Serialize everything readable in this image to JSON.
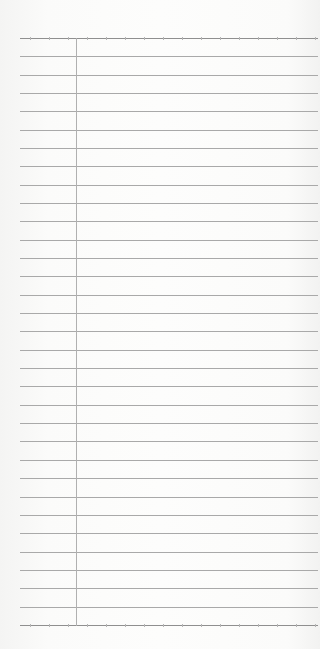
{
  "sheet": {
    "type": "ruled-notepad-page",
    "line_count": 33,
    "first_line_y": 38,
    "line_spacing": 18.34,
    "margin_x": 76,
    "line_color": "#a9a9a9",
    "paper_color": "#fdfdfc"
  }
}
